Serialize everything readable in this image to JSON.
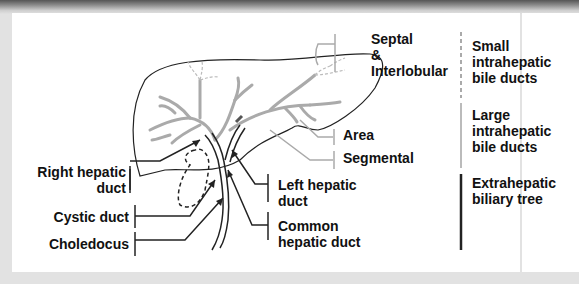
{
  "diagram": {
    "colors": {
      "outline": "#222222",
      "large_ducts": "#aaaaaa",
      "small_ducts": "#bbbbbb",
      "extrahepatic_bar": "#222222",
      "background": "#ffffff",
      "frame": "#e2e2e2"
    },
    "left_labels": [
      {
        "id": "right-hepatic-duct",
        "text": "Right hepatic\nduct"
      },
      {
        "id": "cystic-duct",
        "text": "Cystic duct"
      },
      {
        "id": "choledocus",
        "text": "Choledocus"
      }
    ],
    "center_labels": [
      {
        "id": "left-hepatic-duct",
        "text": "Left hepatic\nduct"
      },
      {
        "id": "common-hepatic-duct",
        "text": "Common\nhepatic duct"
      }
    ],
    "intrahepatic_labels": [
      {
        "id": "septal-interlobular",
        "text": "Septal\n&\nInterlobular"
      },
      {
        "id": "area",
        "text": "Area"
      },
      {
        "id": "segmental",
        "text": "Segmental"
      }
    ],
    "categories": [
      {
        "id": "small-intrahepatic",
        "text": "Small\nintrahepatic\nbile ducts",
        "bar_style": "dashed-gray"
      },
      {
        "id": "large-intrahepatic",
        "text": "Large\nintrahepatic\nbile ducts",
        "bar_style": "solid-gray"
      },
      {
        "id": "extrahepatic",
        "text": "Extrahepatic\nbiliary tree",
        "bar_style": "solid-black"
      }
    ]
  }
}
